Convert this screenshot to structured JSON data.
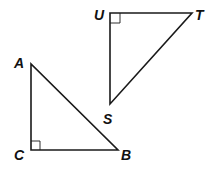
{
  "diagram": {
    "triangles": [
      {
        "name": "ABC",
        "vertices": {
          "A": {
            "x": 31,
            "y": 64
          },
          "C": {
            "x": 31,
            "y": 150
          },
          "B": {
            "x": 118,
            "y": 150
          }
        },
        "right_angle_at": "C",
        "labels": {
          "A": "A",
          "B": "B",
          "C": "C"
        }
      },
      {
        "name": "STU",
        "vertices": {
          "U": {
            "x": 110,
            "y": 13
          },
          "T": {
            "x": 192,
            "y": 13
          },
          "S": {
            "x": 110,
            "y": 104
          }
        },
        "right_angle_at": "U",
        "labels": {
          "U": "U",
          "T": "T",
          "S": "S"
        }
      }
    ]
  }
}
